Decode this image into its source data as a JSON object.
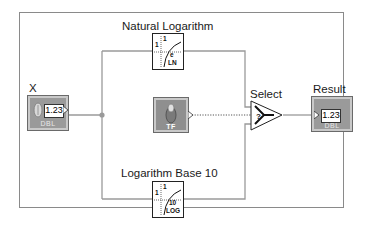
{
  "diagram": {
    "type": "LabVIEW block diagram",
    "labels": {
      "x": "X",
      "natural_log": "Natural Logarithm",
      "log_base_10": "Logarithm Base 10",
      "select": "Select",
      "result": "Result"
    },
    "x_control": {
      "value": "1.23",
      "datatype": "DBL"
    },
    "tf_control": {
      "datatype": "TF"
    },
    "result_indicator": {
      "value": "1.23",
      "datatype": "DBL"
    },
    "ln_node": {
      "top": "1",
      "left": "1",
      "mid": "e",
      "bottom": "LN"
    },
    "log_node": {
      "top": "1",
      "left": "1",
      "mid": "10",
      "bottom": "LOG"
    },
    "select_node": {
      "glyph": "?"
    },
    "colors": {
      "wire": "#9a9a9a",
      "boolean_wire": "#555555",
      "control_fill": "#9a9a9a",
      "frame": "#8a8a8a"
    }
  }
}
